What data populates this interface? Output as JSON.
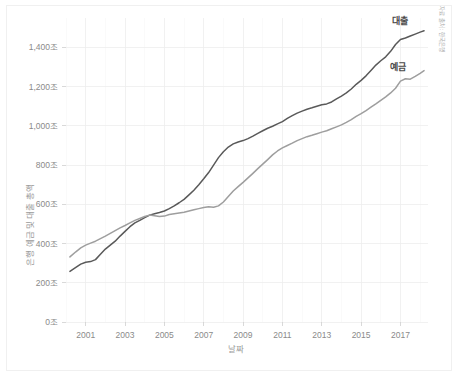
{
  "figure": {
    "source_note": "자료 출처 : 한국은행",
    "background_color": "#ffffff",
    "border_color": "#f0f0f0"
  },
  "chart_data": {
    "type": "line",
    "title": "",
    "xlabel": "날짜",
    "ylabel": "은행 예금 및 대출 총액",
    "xlim": [
      2000.0,
      2018.4
    ],
    "ylim": [
      0,
      1550
    ],
    "grid": true,
    "legend_position": "inline-right",
    "x_tick_labels": [
      "2001",
      "2003",
      "2005",
      "2007",
      "2009",
      "2011",
      "2013",
      "2015",
      "2017"
    ],
    "x_ticks": [
      2001,
      2003,
      2005,
      2007,
      2009,
      2011,
      2013,
      2015,
      2017
    ],
    "y_tick_labels": [
      "0조",
      "200조",
      "400조",
      "600조",
      "800조",
      "1,000조",
      "1,200조",
      "1,400조"
    ],
    "y_ticks": [
      0,
      200,
      400,
      600,
      800,
      1000,
      1200,
      1400
    ],
    "y_unit": "조",
    "series": [
      {
        "name": "대출",
        "color": "#595959",
        "label_x": 2017.0,
        "label_y": 1520,
        "x": [
          2000.2,
          2000.5,
          2000.75,
          2001.0,
          2001.25,
          2001.5,
          2001.75,
          2002.0,
          2002.25,
          2002.5,
          2002.75,
          2003.0,
          2003.25,
          2003.5,
          2003.75,
          2004.0,
          2004.25,
          2004.5,
          2004.75,
          2005.0,
          2005.25,
          2005.5,
          2005.75,
          2006.0,
          2006.25,
          2006.5,
          2006.75,
          2007.0,
          2007.25,
          2007.5,
          2007.75,
          2008.0,
          2008.25,
          2008.5,
          2008.75,
          2009.0,
          2009.25,
          2009.5,
          2009.75,
          2010.0,
          2010.25,
          2010.5,
          2010.75,
          2011.0,
          2011.25,
          2011.5,
          2011.75,
          2012.0,
          2012.25,
          2012.5,
          2012.75,
          2013.0,
          2013.25,
          2013.5,
          2013.75,
          2014.0,
          2014.25,
          2014.5,
          2014.75,
          2015.0,
          2015.25,
          2015.5,
          2015.75,
          2016.0,
          2016.25,
          2016.5,
          2016.75,
          2017.0,
          2017.25,
          2017.5,
          2017.75,
          2018.0,
          2018.2
        ],
        "y": [
          258,
          278,
          295,
          305,
          308,
          318,
          345,
          372,
          392,
          412,
          438,
          462,
          486,
          505,
          518,
          532,
          545,
          552,
          558,
          566,
          578,
          592,
          608,
          625,
          648,
          672,
          700,
          730,
          762,
          800,
          838,
          868,
          892,
          908,
          918,
          925,
          935,
          948,
          962,
          975,
          988,
          998,
          1010,
          1022,
          1038,
          1052,
          1065,
          1075,
          1085,
          1092,
          1100,
          1108,
          1112,
          1122,
          1138,
          1152,
          1168,
          1188,
          1212,
          1232,
          1255,
          1282,
          1310,
          1332,
          1352,
          1380,
          1415,
          1440,
          1448,
          1458,
          1468,
          1478,
          1485
        ]
      },
      {
        "name": "예금",
        "color": "#9e9e9e",
        "label_x": 2016.9,
        "label_y": 1285,
        "x": [
          2000.2,
          2000.5,
          2000.75,
          2001.0,
          2001.25,
          2001.5,
          2001.75,
          2002.0,
          2002.25,
          2002.5,
          2002.75,
          2003.0,
          2003.25,
          2003.5,
          2003.75,
          2004.0,
          2004.25,
          2004.5,
          2004.75,
          2005.0,
          2005.25,
          2005.5,
          2005.75,
          2006.0,
          2006.25,
          2006.5,
          2006.75,
          2007.0,
          2007.25,
          2007.5,
          2007.75,
          2008.0,
          2008.25,
          2008.5,
          2008.75,
          2009.0,
          2009.25,
          2009.5,
          2009.75,
          2010.0,
          2010.25,
          2010.5,
          2010.75,
          2011.0,
          2011.25,
          2011.5,
          2011.75,
          2012.0,
          2012.25,
          2012.5,
          2012.75,
          2013.0,
          2013.25,
          2013.5,
          2013.75,
          2014.0,
          2014.25,
          2014.5,
          2014.75,
          2015.0,
          2015.25,
          2015.5,
          2015.75,
          2016.0,
          2016.25,
          2016.5,
          2016.75,
          2017.0,
          2017.25,
          2017.5,
          2017.75,
          2018.0,
          2018.2
        ],
        "y": [
          332,
          358,
          378,
          392,
          402,
          412,
          425,
          438,
          452,
          466,
          480,
          492,
          505,
          518,
          528,
          538,
          545,
          542,
          538,
          540,
          548,
          552,
          556,
          560,
          566,
          572,
          578,
          584,
          588,
          585,
          592,
          612,
          640,
          668,
          690,
          712,
          735,
          758,
          782,
          805,
          828,
          852,
          872,
          888,
          900,
          912,
          925,
          935,
          945,
          952,
          960,
          968,
          975,
          985,
          995,
          1005,
          1018,
          1032,
          1048,
          1062,
          1078,
          1095,
          1112,
          1130,
          1148,
          1168,
          1192,
          1228,
          1240,
          1238,
          1252,
          1268,
          1282
        ]
      }
    ]
  }
}
